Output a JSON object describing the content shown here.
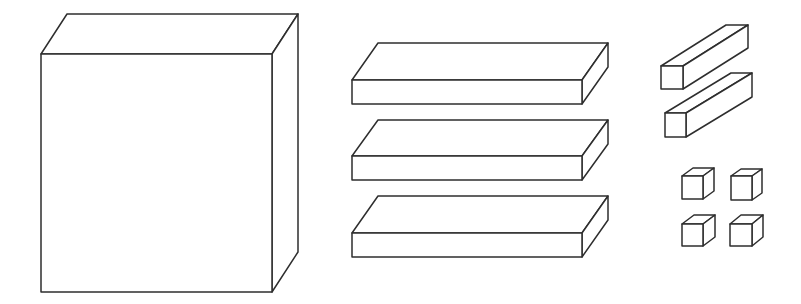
{
  "diagram": {
    "colors": {
      "stroke": "#2e2e2e",
      "fill": "#ffffff",
      "background": "#ffffff"
    },
    "groups": [
      {
        "name": "large-cube",
        "count": 1,
        "shapes": [
          {
            "front": [
              41,
              54,
              272,
              292
            ],
            "offset": [
              26,
              -40
            ]
          }
        ]
      },
      {
        "name": "flats",
        "count": 3,
        "shapes": [
          {
            "front": [
              352,
              80,
              582,
              104
            ],
            "offset": [
              26,
              -37
            ]
          },
          {
            "front": [
              352,
              156,
              582,
              180
            ],
            "offset": [
              26,
              -36
            ]
          },
          {
            "front": [
              352,
              233,
              582,
              257
            ],
            "offset": [
              26,
              -37
            ]
          }
        ]
      },
      {
        "name": "rods",
        "count": 2,
        "shapes": [
          {
            "front": [
              661,
              66,
              683,
              89
            ],
            "offset": [
              65,
              -41
            ]
          },
          {
            "front": [
              665,
              113,
              686,
              137
            ],
            "offset": [
              66,
              -40
            ]
          }
        ]
      },
      {
        "name": "unit-cubes",
        "count": 4,
        "shapes": [
          {
            "front": [
              682,
              176,
              703,
              199
            ],
            "offset": [
              11,
              -8
            ]
          },
          {
            "front": [
              731,
              176,
              752,
              200
            ],
            "offset": [
              10,
              -7
            ]
          },
          {
            "front": [
              682,
              224,
              703,
              246
            ],
            "offset": [
              12,
              -9
            ]
          },
          {
            "front": [
              730,
              224,
              752,
              246
            ],
            "offset": [
              11,
              -9
            ]
          }
        ]
      }
    ]
  }
}
